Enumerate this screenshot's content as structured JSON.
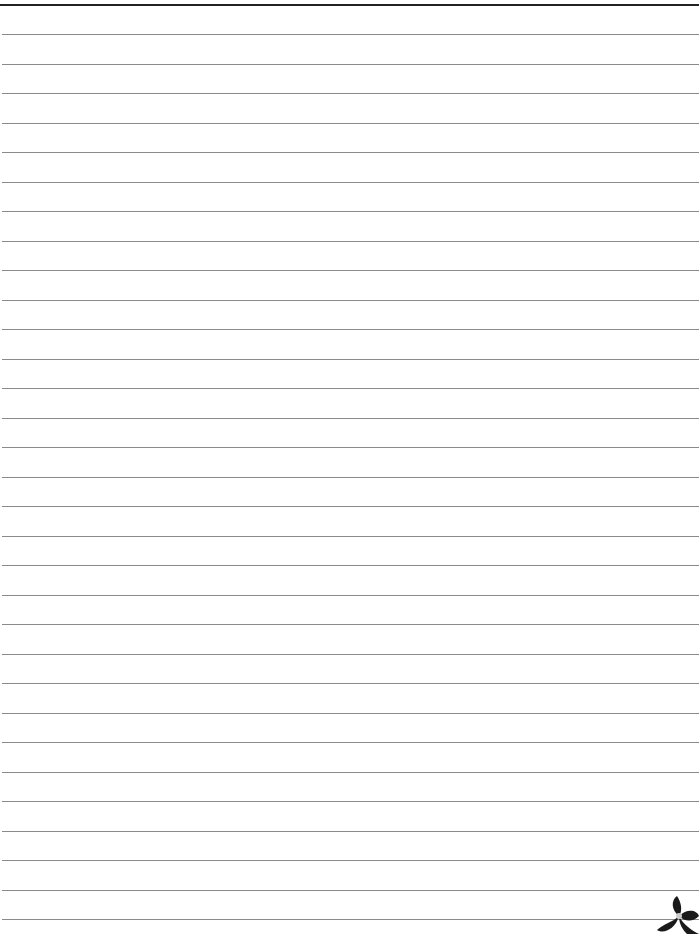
{
  "page": {
    "type": "lined-paper",
    "background_color": "#ffffff",
    "top_rule_color": "#222222",
    "line_color": "#8a8a8a",
    "line_count": 31,
    "first_line_y": 34,
    "line_spacing": 29.5
  },
  "ornament": {
    "icon": "flower-icon",
    "position": "bottom-right",
    "color": "#1a1a1a"
  }
}
